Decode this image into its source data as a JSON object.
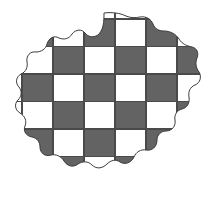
{
  "figure": {
    "background_color": "#ffffff",
    "canvas": {
      "width": 209,
      "height": 198
    }
  },
  "blob": {
    "name": "blob-outline",
    "stroke_color": "#3a3a3a",
    "stroke_width": 1,
    "fill_color": "#ffffff",
    "path": "M 104 13 C 112 12 120 13 126 16 C 131 18 135 18 140 17 C 146 16 151 19 153 24 C 155 29 159 31 164 31 C 170 31 176 34 179 39 C 182 44 187 46 192 47 C 197 48 199 53 197 58 C 195 63 196 68 199 72 C 202 77 200 83 195 85 C 190 87 188 92 189 97 C 190 103 187 108 182 109 C 177 110 174 115 175 120 C 176 126 172 131 166 131 C 161 131 157 135 157 140 C 157 147 152 151 146 150 C 141 149 136 152 134 157 C 131 163 125 165 120 162 C 116 159 111 160 107 164 C 102 169 96 169 92 165 C 88 161 83 161 78 164 C 73 168 67 166 64 161 C 61 156 56 154 51 155 C 45 157 40 153 40 147 C 40 142 37 138 32 137 C 26 136 23 131 25 126 C 27 121 25 116 20 113 C 15 110 14 104 18 100 C 22 96 22 91 19 87 C 15 83 16 77 21 74 C 26 72 28 67 27 62 C 26 56 30 51 36 52 C 41 52 46 49 47 44 C 49 38 54 35 59 38 C 64 40 69 39 72 34 C 76 29 82 29 85 33 C 88 37 93 38 98 35 C 100 33 102 30 103 26 C 104 21 104 17 104 13 Z"
  },
  "checkerboard": {
    "name": "checkerboard-pattern",
    "columns": 6,
    "rows": 6,
    "origin": {
      "x": 22,
      "y": 19
    },
    "cell_width": 31,
    "cell_height": 27.5,
    "dark_color": "#636363",
    "light_color": "#ffffff",
    "grid_line_color": "#4a4a4a",
    "grid_line_width": 1.2,
    "grid_visible": true,
    "grid": [
      [
        0,
        1,
        0,
        1,
        0,
        1
      ],
      [
        1,
        0,
        1,
        0,
        1,
        0
      ],
      [
        0,
        1,
        0,
        1,
        0,
        1
      ],
      [
        1,
        0,
        1,
        0,
        1,
        0
      ],
      [
        0,
        1,
        0,
        1,
        0,
        1
      ],
      [
        1,
        0,
        1,
        0,
        1,
        0
      ]
    ],
    "cell_value_legend": {
      "0": "dark-gray-square",
      "1": "white-square"
    }
  }
}
